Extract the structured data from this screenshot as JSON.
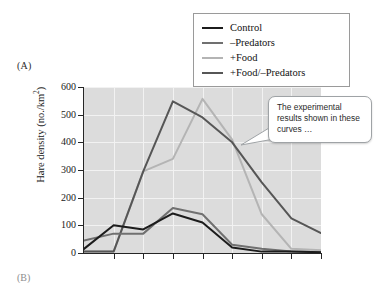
{
  "figure": {
    "panel_label": "(A)",
    "panel_label_next": "(B)"
  },
  "legend": {
    "position": "top-right",
    "entries": [
      {
        "label": "Control",
        "color": "#1c1c1c"
      },
      {
        "label": "–Predators",
        "color": "#707070"
      },
      {
        "label": "+Food",
        "color": "#b4b4b4"
      },
      {
        "label": "+Food/–Predators",
        "color": "#565656"
      }
    ]
  },
  "callout": {
    "text": "The experimental results shown in these curves …"
  },
  "axes": {
    "ylabel_main": "Hare density (no./km",
    "ylabel_sup": "2",
    "ylabel_close": ")",
    "ytick_labels": [
      "600",
      "500",
      "400",
      "300",
      "200",
      "100",
      "0"
    ],
    "xtick_labels": [
      "",
      "",
      "",
      "",
      "",
      "",
      "",
      "",
      ""
    ]
  },
  "chart_data": {
    "type": "line",
    "title": "",
    "xlabel": "",
    "ylabel": "Hare density (no./km2)",
    "ylim": [
      0,
      600
    ],
    "yticks": [
      0,
      100,
      200,
      300,
      400,
      500,
      600
    ],
    "grid": true,
    "x": [
      0,
      1,
      2,
      3,
      4,
      5,
      6,
      7,
      8
    ],
    "series": [
      {
        "name": "Control",
        "color": "#1c1c1c",
        "values": [
          15,
          100,
          85,
          143,
          110,
          20,
          5,
          5,
          3
        ]
      },
      {
        "name": "–Predators",
        "color": "#707070",
        "values": [
          45,
          70,
          70,
          163,
          140,
          30,
          15,
          5,
          3
        ]
      },
      {
        "name": "+Food",
        "color": "#b4b4b4",
        "values": [
          5,
          5,
          295,
          340,
          557,
          410,
          140,
          15,
          10
        ]
      },
      {
        "name": "+Food/–Predators",
        "color": "#565656",
        "values": [
          5,
          5,
          295,
          548,
          490,
          400,
          255,
          125,
          72
        ]
      }
    ]
  }
}
